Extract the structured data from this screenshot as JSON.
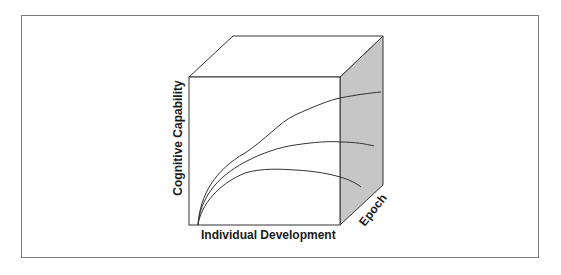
{
  "diagram": {
    "type": "3d-box-diagram",
    "axes": {
      "x_label": "Individual Development",
      "y_label": "Cognitive Capability",
      "z_label": "Epoch"
    },
    "colors": {
      "frame": "#7a7a7a",
      "box_edge": "#333333",
      "side_face": "#c6c6c6",
      "curve": "#333333"
    },
    "curves": [
      {
        "name": "upper",
        "description": "rises steadily, continues rising"
      },
      {
        "name": "middle",
        "description": "rises then levels off"
      },
      {
        "name": "lower",
        "description": "rises, peaks, then declines"
      }
    ]
  }
}
